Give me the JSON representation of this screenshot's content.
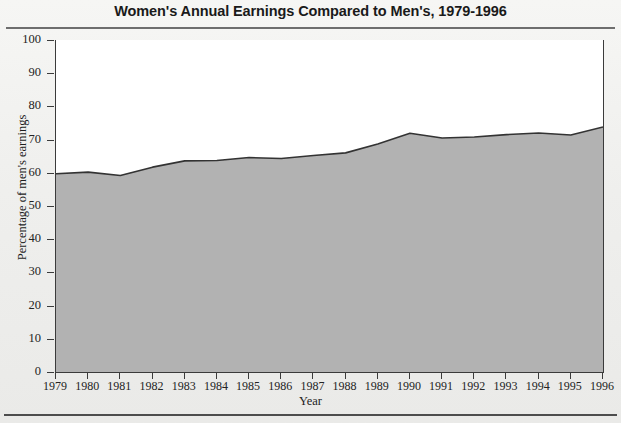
{
  "chart_data": {
    "type": "area",
    "title": "Women's Annual Earnings Compared to Men's, 1979-1996",
    "xlabel": "Year",
    "ylabel": "Percentage of men's earnings",
    "categories": [
      "1979",
      "1980",
      "1981",
      "1982",
      "1983",
      "1984",
      "1985",
      "1986",
      "1987",
      "1988",
      "1989",
      "1990",
      "1991",
      "1992",
      "1993",
      "1994",
      "1995",
      "1996"
    ],
    "x": [
      1979,
      1980,
      1981,
      1982,
      1983,
      1984,
      1985,
      1986,
      1987,
      1988,
      1989,
      1990,
      1991,
      1992,
      1993,
      1994,
      1995,
      1996
    ],
    "values": [
      59.7,
      60.2,
      59.2,
      61.7,
      63.6,
      63.7,
      64.6,
      64.3,
      65.2,
      66.0,
      68.7,
      71.9,
      70.5,
      70.8,
      71.5,
      72.0,
      71.4,
      73.8
    ],
    "ylim": [
      0,
      100
    ],
    "yticks": [
      0,
      10,
      20,
      30,
      40,
      50,
      60,
      70,
      80,
      90,
      100
    ],
    "xlim": [
      1979,
      1996
    ],
    "grid": false,
    "legend": "none",
    "series": [
      {
        "name": "Percentage of men's earnings",
        "values": [
          59.7,
          60.2,
          59.2,
          61.7,
          63.6,
          63.7,
          64.6,
          64.3,
          65.2,
          66.0,
          68.7,
          71.9,
          70.5,
          70.8,
          71.5,
          72.0,
          71.4,
          73.8
        ]
      }
    ]
  },
  "colors": {
    "area_fill": "#b2b2b2",
    "area_line": "#333333",
    "axis": "#3b3b3b",
    "plot_background": "#ffffff",
    "page_background": "#f2f2f0",
    "title_text": "#1a1a1a",
    "rule": "#6e6e6e"
  }
}
